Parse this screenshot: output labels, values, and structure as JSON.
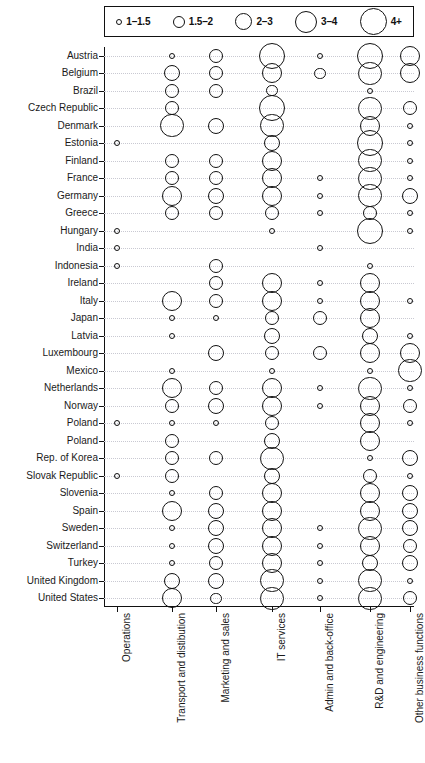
{
  "legend": {
    "items": [
      {
        "label": "1–1.5",
        "size": 6
      },
      {
        "label": "1.5–2",
        "size": 12
      },
      {
        "label": "2–3",
        "size": 17
      },
      {
        "label": "3–4",
        "size": 22
      },
      {
        "label": "4+",
        "size": 27
      }
    ]
  },
  "chart_data": {
    "type": "scatter",
    "title": "",
    "xlabel": "",
    "ylabel": "",
    "grid": true,
    "legend_position": "top",
    "size_legend": [
      "1–1.5",
      "1.5–2",
      "2–3",
      "3–4",
      "4+"
    ],
    "categories_x": [
      "Operations",
      "Transport and distibution",
      "Marketing and sales",
      "IT services",
      "Admin and back-office",
      "R&D and engineering",
      "Other business functions"
    ],
    "categories_y": [
      "Austria",
      "Belgium",
      "Brazil",
      "Czech Republic",
      "Denmark",
      "Estonia",
      "Finland",
      "France",
      "Germany",
      "Greece",
      "Hungary",
      "India",
      "Indonesia",
      "Ireland",
      "Italy",
      "Japan",
      "Latvia",
      "Luxembourg",
      "Mexico",
      "Netherlands",
      "Norway",
      "Poland",
      "Poland",
      "Rep. of Korea",
      "Slovak Republic",
      "Slovenia",
      "Spain",
      "Sweden",
      "Switzerland",
      "Turkey",
      "United Kingdom",
      "United States"
    ],
    "points": [
      {
        "row": "Austria",
        "col": "Transport and distibution",
        "value": 1.2
      },
      {
        "row": "Austria",
        "col": "Marketing and sales",
        "value": 2.2
      },
      {
        "row": "Austria",
        "col": "IT services",
        "value": 4.2
      },
      {
        "row": "Austria",
        "col": "Admin and back-office",
        "value": 1.2
      },
      {
        "row": "Austria",
        "col": "R&D and engineering",
        "value": 4.2
      },
      {
        "row": "Austria",
        "col": "Other business functions",
        "value": 3.1
      },
      {
        "row": "Belgium",
        "col": "Transport and distibution",
        "value": 2.6
      },
      {
        "row": "Belgium",
        "col": "Marketing and sales",
        "value": 2.2
      },
      {
        "row": "Belgium",
        "col": "IT services",
        "value": 3.3
      },
      {
        "row": "Belgium",
        "col": "Admin and back-office",
        "value": 1.9
      },
      {
        "row": "Belgium",
        "col": "R&D and engineering",
        "value": 3.6
      },
      {
        "row": "Belgium",
        "col": "Other business functions",
        "value": 3.0
      },
      {
        "row": "Brazil",
        "col": "Transport and distibution",
        "value": 2.2
      },
      {
        "row": "Brazil",
        "col": "Marketing and sales",
        "value": 2.2
      },
      {
        "row": "Brazil",
        "col": "IT services",
        "value": 1.9
      },
      {
        "row": "Brazil",
        "col": "R&D and engineering",
        "value": 1.2
      },
      {
        "row": "Czech Republic",
        "col": "Transport and distibution",
        "value": 2.1
      },
      {
        "row": "Czech Republic",
        "col": "IT services",
        "value": 4.0
      },
      {
        "row": "Czech Republic",
        "col": "R&D and engineering",
        "value": 3.6
      },
      {
        "row": "Czech Republic",
        "col": "Other business functions",
        "value": 2.1
      },
      {
        "row": "Denmark",
        "col": "Transport and distibution",
        "value": 3.6
      },
      {
        "row": "Denmark",
        "col": "Marketing and sales",
        "value": 2.5
      },
      {
        "row": "Denmark",
        "col": "IT services",
        "value": 3.5
      },
      {
        "row": "Denmark",
        "col": "R&D and engineering",
        "value": 3.4
      },
      {
        "row": "Denmark",
        "col": "Other business functions",
        "value": 1.2
      },
      {
        "row": "Estonia",
        "col": "Operations",
        "value": 1.1
      },
      {
        "row": "Estonia",
        "col": "IT services",
        "value": 2.6
      },
      {
        "row": "Estonia",
        "col": "R&D and engineering",
        "value": 4.1
      },
      {
        "row": "Estonia",
        "col": "Other business functions",
        "value": 1.3
      },
      {
        "row": "Finland",
        "col": "Transport and distibution",
        "value": 2.3
      },
      {
        "row": "Finland",
        "col": "Marketing and sales",
        "value": 2.0
      },
      {
        "row": "Finland",
        "col": "IT services",
        "value": 3.4
      },
      {
        "row": "Finland",
        "col": "R&D and engineering",
        "value": 3.6
      },
      {
        "row": "Finland",
        "col": "Other business functions",
        "value": 1.3
      },
      {
        "row": "France",
        "col": "Transport and distibution",
        "value": 2.3
      },
      {
        "row": "France",
        "col": "Marketing and sales",
        "value": 2.0
      },
      {
        "row": "France",
        "col": "IT services",
        "value": 3.0
      },
      {
        "row": "France",
        "col": "Admin and back-office",
        "value": 1.3
      },
      {
        "row": "France",
        "col": "R&D and engineering",
        "value": 3.5
      },
      {
        "row": "France",
        "col": "Other business functions",
        "value": 1.3
      },
      {
        "row": "Germany",
        "col": "Transport and distibution",
        "value": 3.4
      },
      {
        "row": "Germany",
        "col": "Marketing and sales",
        "value": 2.6
      },
      {
        "row": "Germany",
        "col": "IT services",
        "value": 3.1
      },
      {
        "row": "Germany",
        "col": "Admin and back-office",
        "value": 1.4
      },
      {
        "row": "Germany",
        "col": "R&D and engineering",
        "value": 3.5
      },
      {
        "row": "Germany",
        "col": "Other business functions",
        "value": 2.7
      },
      {
        "row": "Greece",
        "col": "Transport and distibution",
        "value": 2.2
      },
      {
        "row": "Greece",
        "col": "Marketing and sales",
        "value": 2.3
      },
      {
        "row": "Greece",
        "col": "IT services",
        "value": 2.1
      },
      {
        "row": "Greece",
        "col": "Admin and back-office",
        "value": 1.3
      },
      {
        "row": "Greece",
        "col": "R&D and engineering",
        "value": 2.3
      },
      {
        "row": "Greece",
        "col": "Other business functions",
        "value": 1.3
      },
      {
        "row": "Hungary",
        "col": "Operations",
        "value": 1.1
      },
      {
        "row": "Hungary",
        "col": "IT services",
        "value": 1.2
      },
      {
        "row": "Hungary",
        "col": "R&D and engineering",
        "value": 4.2
      },
      {
        "row": "Hungary",
        "col": "Other business functions",
        "value": 1.2
      },
      {
        "row": "India",
        "col": "Operations",
        "value": 1.1
      },
      {
        "row": "India",
        "col": "Admin and back-office",
        "value": 1.2
      },
      {
        "row": "Indonesia",
        "col": "Operations",
        "value": 1.1
      },
      {
        "row": "Indonesia",
        "col": "Marketing and sales",
        "value": 2.1
      },
      {
        "row": "Indonesia",
        "col": "R&D and engineering",
        "value": 1.2
      },
      {
        "row": "Ireland",
        "col": "Marketing and sales",
        "value": 2.2
      },
      {
        "row": "Ireland",
        "col": "IT services",
        "value": 3.1
      },
      {
        "row": "Ireland",
        "col": "Admin and back-office",
        "value": 1.3
      },
      {
        "row": "Ireland",
        "col": "R&D and engineering",
        "value": 3.4
      },
      {
        "row": "Italy",
        "col": "Transport and distibution",
        "value": 3.2
      },
      {
        "row": "Italy",
        "col": "Marketing and sales",
        "value": 2.2
      },
      {
        "row": "Italy",
        "col": "IT services",
        "value": 3.0
      },
      {
        "row": "Italy",
        "col": "Admin and back-office",
        "value": 1.4
      },
      {
        "row": "Italy",
        "col": "R&D and engineering",
        "value": 3.1
      },
      {
        "row": "Italy",
        "col": "Other business functions",
        "value": 1.4
      },
      {
        "row": "Japan",
        "col": "Transport and distibution",
        "value": 1.3
      },
      {
        "row": "Japan",
        "col": "Marketing and sales",
        "value": 1.3
      },
      {
        "row": "Japan",
        "col": "IT services",
        "value": 2.0
      },
      {
        "row": "Japan",
        "col": "Admin and back-office",
        "value": 2.2
      },
      {
        "row": "Japan",
        "col": "R&D and engineering",
        "value": 3.0
      },
      {
        "row": "Latvia",
        "col": "Transport and distibution",
        "value": 1.3
      },
      {
        "row": "Latvia",
        "col": "IT services",
        "value": 2.5
      },
      {
        "row": "Latvia",
        "col": "R&D and engineering",
        "value": 2.9
      },
      {
        "row": "Latvia",
        "col": "Other business functions",
        "value": 1.3
      },
      {
        "row": "Luxembourg",
        "col": "Marketing and sales",
        "value": 2.5
      },
      {
        "row": "Luxembourg",
        "col": "IT services",
        "value": 2.3
      },
      {
        "row": "Luxembourg",
        "col": "Admin and back-office",
        "value": 2.4
      },
      {
        "row": "Luxembourg",
        "col": "R&D and engineering",
        "value": 3.2
      },
      {
        "row": "Luxembourg",
        "col": "Other business functions",
        "value": 3.3
      },
      {
        "row": "Mexico",
        "col": "Transport and distibution",
        "value": 1.3
      },
      {
        "row": "Mexico",
        "col": "IT services",
        "value": 1.3
      },
      {
        "row": "Mexico",
        "col": "R&D and engineering",
        "value": 1.2
      },
      {
        "row": "Mexico",
        "col": "Other business functions",
        "value": 3.8
      },
      {
        "row": "Netherlands",
        "col": "Transport and distibution",
        "value": 3.3
      },
      {
        "row": "Netherlands",
        "col": "Marketing and sales",
        "value": 2.4
      },
      {
        "row": "Netherlands",
        "col": "IT services",
        "value": 3.2
      },
      {
        "row": "Netherlands",
        "col": "Admin and back-office",
        "value": 1.3
      },
      {
        "row": "Netherlands",
        "col": "R&D and engineering",
        "value": 3.5
      },
      {
        "row": "Netherlands",
        "col": "Other business functions",
        "value": 1.2
      },
      {
        "row": "Norway",
        "col": "Transport and distibution",
        "value": 2.1
      },
      {
        "row": "Norway",
        "col": "Marketing and sales",
        "value": 2.8
      },
      {
        "row": "Norway",
        "col": "IT services",
        "value": 3.2
      },
      {
        "row": "Norway",
        "col": "Admin and back-office",
        "value": 1.3
      },
      {
        "row": "Norway",
        "col": "R&D and engineering",
        "value": 3.2
      },
      {
        "row": "Norway",
        "col": "Other business functions",
        "value": 2.4
      },
      {
        "row": "Poland",
        "col": "Transport and distibution",
        "value": 1.3
      },
      {
        "row": "Poland",
        "col": "Marketing and sales",
        "value": 1.3
      },
      {
        "row": "Poland",
        "col": "IT services",
        "value": 2.1
      },
      {
        "row": "Poland",
        "col": "R&D and engineering",
        "value": 3.3
      },
      {
        "row": "Poland",
        "col": "Other business functions",
        "value": 1.2
      },
      {
        "row": "Poland",
        "col": "Operations",
        "value": 1.1
      },
      {
        "row": "Poland",
        "col": "Transport and distibution",
        "value": 2.2
      },
      {
        "row": "Poland",
        "col": "IT services",
        "value": 2.9
      },
      {
        "row": "Poland",
        "col": "R&D and engineering",
        "value": 3.0
      },
      {
        "row": "Rep. of Korea",
        "col": "Transport and distibution",
        "value": 2.2
      },
      {
        "row": "Rep. of Korea",
        "col": "Marketing and sales",
        "value": 2.4
      },
      {
        "row": "Rep. of Korea",
        "col": "IT services",
        "value": 3.5
      },
      {
        "row": "Rep. of Korea",
        "col": "R&D and engineering",
        "value": 1.3
      },
      {
        "row": "Rep. of Korea",
        "col": "Other business functions",
        "value": 2.6
      },
      {
        "row": "Slovak Republic",
        "col": "Operations",
        "value": 1.1
      },
      {
        "row": "Slovak Republic",
        "col": "Transport and distibution",
        "value": 2.2
      },
      {
        "row": "Slovak Republic",
        "col": "IT services",
        "value": 2.8
      },
      {
        "row": "Slovak Republic",
        "col": "R&D and engineering",
        "value": 2.4
      },
      {
        "row": "Slovak Republic",
        "col": "Other business functions",
        "value": 1.3
      },
      {
        "row": "Slovenia",
        "col": "Transport and distibution",
        "value": 1.3
      },
      {
        "row": "Slovenia",
        "col": "Marketing and sales",
        "value": 2.0
      },
      {
        "row": "Slovenia",
        "col": "IT services",
        "value": 3.1
      },
      {
        "row": "Slovenia",
        "col": "R&D and engineering",
        "value": 3.4
      },
      {
        "row": "Slovenia",
        "col": "Other business functions",
        "value": 2.8
      },
      {
        "row": "Spain",
        "col": "Transport and distibution",
        "value": 3.0
      },
      {
        "row": "Spain",
        "col": "Marketing and sales",
        "value": 2.5
      },
      {
        "row": "Spain",
        "col": "IT services",
        "value": 3.3
      },
      {
        "row": "Spain",
        "col": "R&D and engineering",
        "value": 3.4
      },
      {
        "row": "Spain",
        "col": "Other business functions",
        "value": 2.8
      },
      {
        "row": "Sweden",
        "col": "Transport and distibution",
        "value": 1.3
      },
      {
        "row": "Sweden",
        "col": "Marketing and sales",
        "value": 2.6
      },
      {
        "row": "Sweden",
        "col": "IT services",
        "value": 3.4
      },
      {
        "row": "Sweden",
        "col": "Admin and back-office",
        "value": 1.3
      },
      {
        "row": "Sweden",
        "col": "R&D and engineering",
        "value": 3.5
      },
      {
        "row": "Sweden",
        "col": "Other business functions",
        "value": 2.7
      },
      {
        "row": "Switzerland",
        "col": "Transport and distibution",
        "value": 1.3
      },
      {
        "row": "Switzerland",
        "col": "Marketing and sales",
        "value": 2.5
      },
      {
        "row": "Switzerland",
        "col": "IT services",
        "value": 3.3
      },
      {
        "row": "Switzerland",
        "col": "Admin and back-office",
        "value": 1.3
      },
      {
        "row": "Switzerland",
        "col": "R&D and engineering",
        "value": 3.3
      },
      {
        "row": "Switzerland",
        "col": "Other business functions",
        "value": 2.3
      },
      {
        "row": "Turkey",
        "col": "Transport and distibution",
        "value": 1.3
      },
      {
        "row": "Turkey",
        "col": "Marketing and sales",
        "value": 2.2
      },
      {
        "row": "Turkey",
        "col": "IT services",
        "value": 3.0
      },
      {
        "row": "Turkey",
        "col": "Admin and back-office",
        "value": 1.3
      },
      {
        "row": "Turkey",
        "col": "R&D and engineering",
        "value": 2.8
      },
      {
        "row": "Turkey",
        "col": "Other business functions",
        "value": 2.8
      },
      {
        "row": "United Kingdom",
        "col": "Transport and distibution",
        "value": 2.5
      },
      {
        "row": "United Kingdom",
        "col": "Marketing and sales",
        "value": 2.6
      },
      {
        "row": "United Kingdom",
        "col": "IT services",
        "value": 3.8
      },
      {
        "row": "United Kingdom",
        "col": "Admin and back-office",
        "value": 1.3
      },
      {
        "row": "United Kingdom",
        "col": "R&D and engineering",
        "value": 3.7
      },
      {
        "row": "United Kingdom",
        "col": "Other business functions",
        "value": 1.3
      },
      {
        "row": "United States",
        "col": "Transport and distibution",
        "value": 3.1
      },
      {
        "row": "United States",
        "col": "Marketing and sales",
        "value": 1.9
      },
      {
        "row": "United States",
        "col": "IT services",
        "value": 3.5
      },
      {
        "row": "United States",
        "col": "Admin and back-office",
        "value": 1.3
      },
      {
        "row": "United States",
        "col": "R&D and engineering",
        "value": 3.9
      },
      {
        "row": "United States",
        "col": "Other business functions",
        "value": 2.4
      }
    ]
  }
}
